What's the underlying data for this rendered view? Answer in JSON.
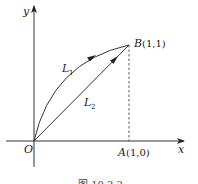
{
  "diagram": {
    "axes": {
      "x_label": "x",
      "y_label": "y",
      "origin_label": "O"
    },
    "points": {
      "A": {
        "name": "A",
        "coords": "(1,0)"
      },
      "B": {
        "name": "B",
        "coords": "(1,1)"
      }
    },
    "curves": [
      {
        "name": "L",
        "sub": "1",
        "type": "arc from O to B"
      },
      {
        "name": "L",
        "sub": "2",
        "type": "straight segment from O to B"
      }
    ],
    "caption": "图 10.2.2"
  }
}
